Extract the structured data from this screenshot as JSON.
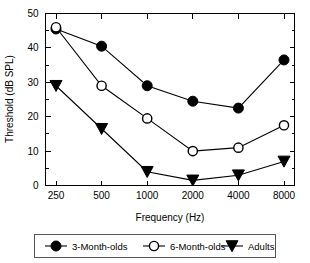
{
  "chart_data": {
    "type": "line",
    "title": "",
    "xlabel": "Frequency (Hz)",
    "ylabel": "Threshold (dB SPL)",
    "categories": [
      "250",
      "500",
      "1000",
      "2000",
      "4000",
      "8000"
    ],
    "x_tick_labels": [
      "250",
      "500",
      "1000",
      "2000",
      "4000",
      "8000"
    ],
    "y_tick_labels": [
      "0",
      "10",
      "20",
      "30",
      "40",
      "50"
    ],
    "y_ticks": [
      0,
      10,
      20,
      30,
      40,
      50
    ],
    "y_minor_ticks": [
      5,
      15,
      25,
      35,
      45
    ],
    "ylim": [
      0,
      50
    ],
    "grid": false,
    "legend_position": "below-plot",
    "series": [
      {
        "name": "3-Month-olds",
        "marker": "filled-circle",
        "color": "#000000",
        "values": [
          45.5,
          40.5,
          29.0,
          24.5,
          22.5,
          36.5
        ]
      },
      {
        "name": "6-Month-olds",
        "marker": "open-circle",
        "color": "#000000",
        "values": [
          46.0,
          29.0,
          19.5,
          10.0,
          11.0,
          17.5
        ]
      },
      {
        "name": "Adults",
        "marker": "filled-triangle-down",
        "color": "#000000",
        "values": [
          29.0,
          16.5,
          4.0,
          1.5,
          3.0,
          7.0
        ]
      }
    ]
  },
  "legend": {
    "entries": [
      {
        "label": "3-Month-olds",
        "marker": "filled-circle"
      },
      {
        "label": "6-Month-olds",
        "marker": "open-circle"
      },
      {
        "label": "Adults",
        "marker": "filled-triangle-down"
      }
    ]
  },
  "colors": {
    "ink": "#000000",
    "background": "#ffffff",
    "legend_border": "#555555"
  }
}
